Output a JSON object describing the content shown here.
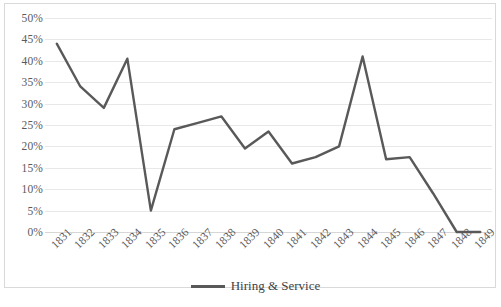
{
  "chart_data": {
    "type": "line",
    "title": "",
    "xlabel": "",
    "ylabel": "",
    "categories": [
      "1831",
      "1832",
      "1833",
      "1834",
      "1835",
      "1836",
      "1837",
      "1838",
      "1839",
      "1840",
      "1841",
      "1842",
      "1843",
      "1844",
      "1845",
      "1846",
      "1847",
      "1848",
      "1849"
    ],
    "values": [
      44,
      34,
      29,
      40.5,
      5,
      24,
      25.5,
      27,
      19.5,
      23.5,
      16,
      17.5,
      20,
      41,
      17,
      17.5,
      9,
      0,
      0
    ],
    "series": [
      {
        "name": "Hiring & Service",
        "color": "#595959",
        "values": [
          44,
          34,
          29,
          40.5,
          5,
          24,
          25.5,
          27,
          19.5,
          23.5,
          16,
          17.5,
          20,
          41,
          17,
          17.5,
          9,
          0,
          0
        ]
      }
    ],
    "ylim": [
      0,
      50
    ],
    "y_ticks": [
      0,
      5,
      10,
      15,
      20,
      25,
      30,
      35,
      40,
      45,
      50
    ],
    "y_tick_labels": [
      "0%",
      "5%",
      "10%",
      "15%",
      "20%",
      "25%",
      "30%",
      "35%",
      "40%",
      "45%",
      "50%"
    ],
    "value_format": "percent",
    "grid": true,
    "grid_axis": "y",
    "legend_position": "bottom",
    "legend_entries": [
      "Hiring & Service"
    ]
  },
  "legend": {
    "label": "Hiring & Service"
  },
  "caption": {
    "text": ""
  }
}
